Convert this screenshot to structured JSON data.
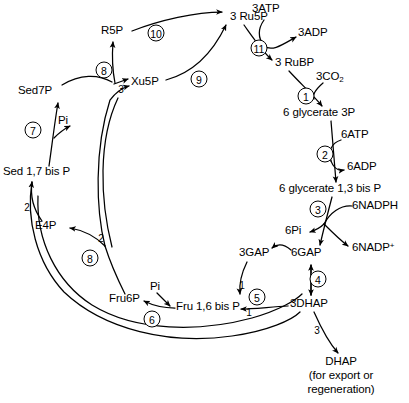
{
  "diagram": {
    "type": "biochemical-pathway",
    "stroke_color": "#000000",
    "background_color": "#ffffff",
    "metabolites": [
      {
        "id": "r5p",
        "label": "R5P",
        "x": 112,
        "y": 31,
        "align": "ctr"
      },
      {
        "id": "ru5p",
        "label": "3 Ru5P",
        "x": 230,
        "y": 17,
        "align": "left"
      },
      {
        "id": "atp3",
        "label": "3ATP",
        "x": 252,
        "y": 10,
        "align": "left"
      },
      {
        "id": "adp3",
        "label": "3ADP",
        "x": 303,
        "y": 33,
        "align": "left"
      },
      {
        "id": "rubp",
        "label": "3 RuBP",
        "x": 278,
        "y": 63,
        "align": "left"
      },
      {
        "id": "co2",
        "label": "3CO2",
        "x": 318,
        "y": 77,
        "align": "left",
        "sub": "2"
      },
      {
        "id": "glyc3p",
        "label": "6 glycerate 3P",
        "x": 286,
        "y": 113,
        "align": "left"
      },
      {
        "id": "atp6",
        "label": "6ATP",
        "x": 342,
        "y": 135,
        "align": "left"
      },
      {
        "id": "adp6",
        "label": "6ADP",
        "x": 348,
        "y": 166,
        "align": "left"
      },
      {
        "id": "glyc13bisp",
        "label": "6 glycerate 1,3 bis P",
        "x": 282,
        "y": 189,
        "align": "left"
      },
      {
        "id": "nadph6",
        "label": "6NADPH",
        "x": 353,
        "y": 211,
        "align": "left"
      },
      {
        "id": "pi6",
        "label": "6Pi",
        "x": 288,
        "y": 230,
        "align": "left"
      },
      {
        "id": "nadp6",
        "label": "6NADP+",
        "x": 353,
        "y": 248,
        "align": "left",
        "sup": "+"
      },
      {
        "id": "gap6",
        "label": "6GAP",
        "x": 294,
        "y": 253,
        "align": "left"
      },
      {
        "id": "gap3",
        "label": "3GAP",
        "x": 243,
        "y": 253,
        "align": "left"
      },
      {
        "id": "dhap3",
        "label": "3DHAP",
        "x": 294,
        "y": 304,
        "align": "left"
      },
      {
        "id": "dhap_out",
        "label": "DHAP",
        "x": 341,
        "y": 362,
        "align": "ctr"
      },
      {
        "id": "dhap_note",
        "label": "(for export or\nregeneration)",
        "x": 341,
        "y": 374,
        "align": "ctr",
        "multiline": true
      },
      {
        "id": "fru16bisp",
        "label": "Fru 1,6 bis P",
        "x": 179,
        "y": 307,
        "align": "left"
      },
      {
        "id": "fru6p",
        "label": "Fru6P",
        "x": 112,
        "y": 299,
        "align": "left"
      },
      {
        "id": "pi_f",
        "label": "Pi",
        "x": 152,
        "y": 288,
        "align": "left"
      },
      {
        "id": "e4p",
        "label": "E4P",
        "x": 37,
        "y": 226,
        "align": "left"
      },
      {
        "id": "sed17bisp",
        "label": "Sed 1,7 bis P",
        "x": 5,
        "y": 172,
        "align": "left"
      },
      {
        "id": "pi_s",
        "label": "Pi",
        "x": 60,
        "y": 121,
        "align": "left"
      },
      {
        "id": "sed7p",
        "label": "Sed7P",
        "x": 20,
        "y": 91,
        "align": "left"
      },
      {
        "id": "xu5p",
        "label": "Xu5P",
        "x": 133,
        "y": 82,
        "align": "left"
      }
    ],
    "steps": [
      {
        "n": "1",
        "x": 306,
        "y": 96
      },
      {
        "n": "2",
        "x": 325,
        "y": 154
      },
      {
        "n": "3",
        "x": 318,
        "y": 209
      },
      {
        "n": "4",
        "x": 318,
        "y": 279
      },
      {
        "n": "5",
        "x": 257,
        "y": 297
      },
      {
        "n": "6",
        "x": 152,
        "y": 319
      },
      {
        "n": "7",
        "x": 33,
        "y": 130
      },
      {
        "n": "8",
        "x": 104,
        "y": 70
      },
      {
        "n": "8",
        "x": 90,
        "y": 258
      },
      {
        "n": "9",
        "x": 199,
        "y": 79
      },
      {
        "n": "10",
        "x": 156,
        "y": 33
      },
      {
        "n": "11",
        "x": 259,
        "y": 48
      }
    ],
    "stoichiometry": [
      {
        "label": "3",
        "x": 121,
        "y": 89
      },
      {
        "label": "1",
        "x": 242,
        "y": 285
      },
      {
        "label": "1",
        "x": 249,
        "y": 312
      },
      {
        "label": "2",
        "x": 101,
        "y": 238
      },
      {
        "label": "2",
        "x": 27,
        "y": 207
      },
      {
        "label": "3",
        "x": 317,
        "y": 330
      }
    ],
    "enzyme_key": [
      {
        "n": "1",
        "name": "ribulose bisphosphate carboxylase"
      },
      {
        "n": "2",
        "name": "phosphoglycerate kinase"
      },
      {
        "n": "3",
        "name": "glyceraldehyde 3-phosphate dehydrogenase"
      },
      {
        "n": "4",
        "name": "triose phosphate isomerase"
      },
      {
        "n": "5",
        "name": "aldolase"
      },
      {
        "n": "6",
        "name": "fructose bisphosphatase"
      },
      {
        "n": "7",
        "name": "sedoheptulose bisphosphatase"
      },
      {
        "n": "8",
        "name": "transketolase"
      },
      {
        "n": "9",
        "name": "ribulose phosphate epimerase"
      },
      {
        "n": "10",
        "name": "ribose phosphate isomerase"
      },
      {
        "n": "11",
        "name": "ribulose phosphate kinase"
      }
    ]
  }
}
